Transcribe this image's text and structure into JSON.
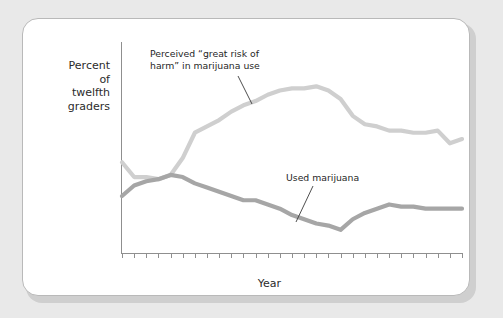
{
  "figure": {
    "background_color": "#e9e9e9",
    "card_color": "#ffffff",
    "border_color": "#b9b9b9"
  },
  "chart_data": {
    "type": "line",
    "title": "",
    "xlabel": "Year",
    "ylabel": "Percent of twelfth graders",
    "ylabel_lines": [
      "Percent",
      "of",
      "twelfth",
      "graders"
    ],
    "grid": true,
    "legend": "none (inline annotations)",
    "xlim": [
      1975,
      2003
    ],
    "ylim": [
      0,
      100
    ],
    "yticks": [
      0,
      10,
      20,
      30,
      40,
      50,
      60,
      70,
      80,
      90,
      100
    ],
    "ytick_labels": [
      "0",
      "10",
      "20",
      "30",
      "40",
      "50",
      "60",
      "70",
      "80",
      "90",
      "100%"
    ],
    "x": [
      1975,
      1976,
      1977,
      1978,
      1979,
      1980,
      1981,
      1982,
      1983,
      1984,
      1985,
      1986,
      1987,
      1988,
      1989,
      1990,
      1991,
      1992,
      1993,
      1994,
      1995,
      1996,
      1997,
      1998,
      1999,
      2000,
      2001,
      2002,
      2003
    ],
    "xtick_labels": [
      "'75",
      "",
      "'77",
      "",
      "'79",
      "",
      "'81",
      "",
      "'83",
      "",
      "'85",
      "",
      "'87",
      "",
      "'89",
      "",
      "'91",
      "",
      "'93",
      "",
      "'95",
      "",
      "'97",
      "",
      "'99",
      "",
      "2001",
      "",
      "'03"
    ],
    "series": [
      {
        "name": "Perceived “great risk of harm” in marijuana use",
        "color": "#cfcfcf",
        "values": [
          43,
          36,
          36,
          35,
          37,
          45,
          57,
          60,
          63,
          67,
          70,
          72,
          75,
          77,
          78,
          78,
          79,
          77,
          73,
          65,
          61,
          60,
          58,
          58,
          57,
          57,
          58,
          52,
          54
        ]
      },
      {
        "name": "Used marijuana",
        "color": "#a6a6a6",
        "values": [
          27,
          32,
          34,
          35,
          37,
          36,
          33,
          31,
          29,
          27,
          25,
          25,
          23,
          21,
          18,
          16,
          14,
          13,
          11,
          16,
          19,
          21,
          23,
          22,
          22,
          21,
          21,
          21,
          21
        ]
      }
    ],
    "annotations": [
      {
        "id": "risk-annotation",
        "text": "Perceived “great risk of\nharm” in marijuana use",
        "leader_from_x": 238,
        "leader_from_y": 76,
        "leader_to_x": 252,
        "leader_to_y": 104
      },
      {
        "id": "used-annotation",
        "text": "Used marijuana",
        "leader_from_x": 313,
        "leader_from_y": 186,
        "leader_to_x": 296,
        "leader_to_y": 222
      }
    ]
  }
}
